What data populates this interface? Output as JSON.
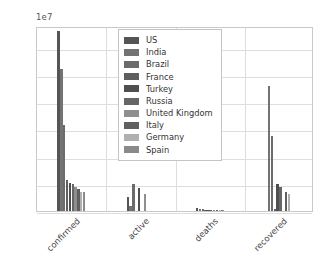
{
  "chart_data": {
    "type": "bar",
    "title": "",
    "xlabel": "",
    "ylabel": "",
    "y_offset_text": "1e7",
    "y_offset_value": 10000000,
    "ylim": [
      0,
      34000000
    ],
    "yticks": [
      "0.0",
      "0.5",
      "1.0",
      "1.5",
      "2.0",
      "2.5",
      "3.0"
    ],
    "ytick_values": [
      0,
      5000000,
      10000000,
      15000000,
      20000000,
      25000000,
      30000000
    ],
    "grid": true,
    "grid_axis": "both",
    "legend_position": "upper center",
    "categories": [
      "confirmed",
      "active",
      "deaths",
      "recovered"
    ],
    "series": [
      {
        "name": "US",
        "color": "#555555",
        "values": [
          33100000,
          2500000,
          590000,
          0
        ]
      },
      {
        "name": "India",
        "color": "#737373",
        "values": [
          26100000,
          1000000,
          295000,
          23000000
        ]
      },
      {
        "name": "Brazil",
        "color": "#6b6b6b",
        "values": [
          15900000,
          4900000,
          444000,
          13800000
        ]
      },
      {
        "name": "France",
        "color": "#5e5e5e",
        "values": [
          5760000,
          0,
          106000,
          350000
        ]
      },
      {
        "name": "Turkey",
        "color": "#4f4f4f",
        "values": [
          5120000,
          4200000,
          44000,
          4900000
        ]
      },
      {
        "name": "Russia",
        "color": "#666666",
        "values": [
          4890000,
          0,
          112000,
          4500000
        ]
      },
      {
        "name": "United Kingdom",
        "color": "#8f8f8f",
        "values": [
          4450000,
          3200000,
          127000,
          0
        ]
      },
      {
        "name": "Italy",
        "color": "#606060",
        "values": [
          4120000,
          0,
          123000,
          3500000
        ]
      },
      {
        "name": "Germany",
        "color": "#b0b0b0",
        "values": [
          3520000,
          0,
          85000,
          3100000
        ]
      },
      {
        "name": "Spain",
        "color": "#8a8a8a",
        "values": [
          3540000,
          0,
          79000,
          0
        ]
      }
    ]
  },
  "legend": {
    "items": [
      {
        "label": "US"
      },
      {
        "label": "India"
      },
      {
        "label": "Brazil"
      },
      {
        "label": "France"
      },
      {
        "label": "Turkey"
      },
      {
        "label": "Russia"
      },
      {
        "label": "United Kingdom"
      },
      {
        "label": "Italy"
      },
      {
        "label": "Germany"
      },
      {
        "label": "Spain"
      }
    ]
  },
  "axes": {
    "offset_label": "1e7",
    "y_tick_labels": [
      "0.0",
      "0.5",
      "1.0",
      "1.5",
      "2.0",
      "2.5",
      "3.0"
    ],
    "x_tick_labels": [
      "confirmed",
      "active",
      "deaths",
      "recovered"
    ]
  },
  "style": {
    "background": "#ffffff",
    "grid_color": "#dedede",
    "axis_color": "#c9c9c9",
    "text_color": "#444444"
  }
}
